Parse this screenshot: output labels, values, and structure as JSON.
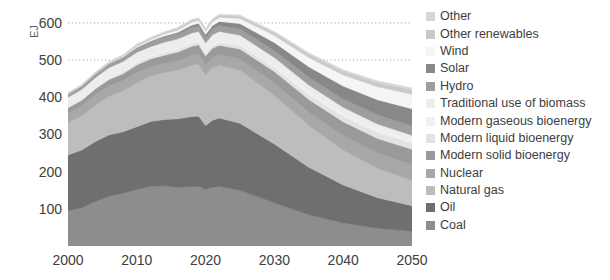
{
  "chart_data": {
    "type": "area",
    "stacked": true,
    "title": "",
    "xlabel": "",
    "ylabel": "EJ",
    "xlim": [
      2000,
      2050
    ],
    "ylim": [
      0,
      640
    ],
    "ytick_labels": [
      "600",
      "500",
      "400",
      "300",
      "200",
      "100"
    ],
    "ytick_values": [
      600,
      500,
      400,
      300,
      200,
      100
    ],
    "xtick_labels": [
      "2000",
      "2010",
      "2020",
      "2030",
      "2040",
      "2050"
    ],
    "xtick_values": [
      2000,
      2010,
      2020,
      2030,
      2040,
      2050
    ],
    "grid": "dotted horizontal gridlines at 500 and 600 only",
    "gridline_values": [
      500,
      600
    ],
    "legend_position": "right",
    "x": [
      2000,
      2002,
      2004,
      2006,
      2008,
      2010,
      2012,
      2014,
      2016,
      2018,
      2019,
      2020,
      2021,
      2022,
      2025,
      2030,
      2035,
      2040,
      2045,
      2050
    ],
    "series": [
      {
        "name": "Coal",
        "color": "#8d8d8d",
        "values": [
          95,
          103,
          120,
          134,
          142,
          152,
          161,
          162,
          158,
          160,
          160,
          152,
          158,
          160,
          150,
          116,
          84,
          62,
          48,
          40
        ]
      },
      {
        "name": "Oil",
        "color": "#6f6f6f",
        "values": [
          150,
          155,
          161,
          165,
          165,
          169,
          174,
          178,
          184,
          188,
          189,
          172,
          180,
          184,
          180,
          158,
          128,
          102,
          82,
          68
        ]
      },
      {
        "name": "Natural gas",
        "color": "#bdbdbd",
        "values": [
          87,
          92,
          98,
          104,
          110,
          117,
          122,
          126,
          131,
          138,
          140,
          136,
          141,
          142,
          143,
          131,
          112,
          94,
          79,
          68
        ]
      },
      {
        "name": "Nuclear",
        "color": "#a8a8a8",
        "values": [
          26,
          27,
          28,
          28,
          28,
          29,
          25,
          25,
          26,
          27,
          28,
          27,
          28,
          29,
          30,
          33,
          36,
          39,
          41,
          43
        ]
      },
      {
        "name": "Modern solid bioenergy",
        "color": "#9a9a9a",
        "values": [
          14,
          15,
          16,
          17,
          18,
          20,
          21,
          22,
          23,
          24,
          24,
          24,
          25,
          25,
          27,
          31,
          34,
          37,
          39,
          41
        ]
      },
      {
        "name": "Modern liquid bioenergy",
        "color": "#e3e3e3",
        "values": [
          1,
          2,
          3,
          4,
          5,
          6,
          6,
          7,
          7,
          8,
          8,
          7,
          8,
          8,
          9,
          11,
          13,
          15,
          16,
          17
        ]
      },
      {
        "name": "Modern gaseous bioenergy",
        "color": "#f0f0f0",
        "values": [
          1,
          1,
          1,
          2,
          2,
          2,
          2,
          3,
          3,
          3,
          3,
          3,
          3,
          4,
          4,
          5,
          7,
          8,
          10,
          11
        ]
      },
      {
        "name": "Traditional use of biomass",
        "color": "#ededed",
        "values": [
          26,
          26,
          26,
          26,
          26,
          26,
          25,
          25,
          25,
          25,
          25,
          25,
          25,
          25,
          24,
          22,
          19,
          16,
          13,
          10
        ]
      },
      {
        "name": "Hydro",
        "color": "#9e9e9e",
        "values": [
          9,
          10,
          10,
          11,
          11,
          12,
          13,
          14,
          14,
          15,
          15,
          15,
          16,
          16,
          17,
          19,
          21,
          23,
          25,
          26
        ]
      },
      {
        "name": "Solar",
        "color": "#888888",
        "values": [
          0,
          0,
          0,
          0,
          1,
          1,
          2,
          3,
          4,
          6,
          7,
          8,
          9,
          11,
          14,
          21,
          28,
          34,
          40,
          45
        ]
      },
      {
        "name": "Wind",
        "color": "#f5f5f5",
        "values": [
          0,
          0,
          1,
          1,
          2,
          3,
          4,
          5,
          6,
          8,
          8,
          9,
          10,
          11,
          14,
          19,
          25,
          30,
          35,
          39
        ]
      },
      {
        "name": "Other renewables",
        "color": "#c9c9c9",
        "values": [
          2,
          2,
          3,
          3,
          3,
          4,
          4,
          4,
          5,
          5,
          5,
          5,
          6,
          6,
          6,
          8,
          9,
          10,
          11,
          12
        ]
      },
      {
        "name": "Other",
        "color": "#d6d6d6",
        "values": [
          1,
          1,
          1,
          1,
          1,
          2,
          2,
          2,
          2,
          2,
          2,
          2,
          2,
          2,
          3,
          3,
          4,
          4,
          5,
          5
        ]
      }
    ],
    "totals_note": "Peak total ~600 EJ around 2019; ~350 EJ by 2050",
    "stack_order_bottom_to_top": [
      "Coal",
      "Oil",
      "Natural gas",
      "Nuclear",
      "Modern solid bioenergy",
      "Modern liquid bioenergy",
      "Modern gaseous bioenergy",
      "Traditional use of biomass",
      "Hydro",
      "Solar",
      "Wind",
      "Other renewables",
      "Other"
    ]
  },
  "axis": {
    "y_title": "EJ",
    "y_ticks": [
      {
        "label": "600",
        "value": 600
      },
      {
        "label": "500",
        "value": 500
      },
      {
        "label": "400",
        "value": 400
      },
      {
        "label": "300",
        "value": 300
      },
      {
        "label": "200",
        "value": 200
      },
      {
        "label": "100",
        "value": 100
      }
    ],
    "x_ticks": [
      {
        "label": "2000",
        "value": 2000
      },
      {
        "label": "2010",
        "value": 2010
      },
      {
        "label": "2020",
        "value": 2020
      },
      {
        "label": "2030",
        "value": 2030
      },
      {
        "label": "2040",
        "value": 2040
      },
      {
        "label": "2050",
        "value": 2050
      }
    ]
  },
  "legend": {
    "items": [
      {
        "label": "Other",
        "color": "#d6d6d6"
      },
      {
        "label": "Other renewables",
        "color": "#c9c9c9"
      },
      {
        "label": "Wind",
        "color": "#f5f5f5"
      },
      {
        "label": "Solar",
        "color": "#888888"
      },
      {
        "label": "Hydro",
        "color": "#9e9e9e"
      },
      {
        "label": "Traditional use of biomass",
        "color": "#ededed"
      },
      {
        "label": "Modern gaseous bioenergy",
        "color": "#f0f0f0"
      },
      {
        "label": "Modern liquid bioenergy",
        "color": "#e3e3e3"
      },
      {
        "label": "Modern solid bioenergy",
        "color": "#9a9a9a"
      },
      {
        "label": "Nuclear",
        "color": "#a8a8a8"
      },
      {
        "label": "Natural gas",
        "color": "#bdbdbd"
      },
      {
        "label": "Oil",
        "color": "#6f6f6f"
      },
      {
        "label": "Coal",
        "color": "#8d8d8d"
      }
    ]
  },
  "colors": {
    "text": "#404040",
    "axis_text": "#3d3d3d",
    "gridline": "#bbbbbb",
    "background": "#ffffff"
  }
}
